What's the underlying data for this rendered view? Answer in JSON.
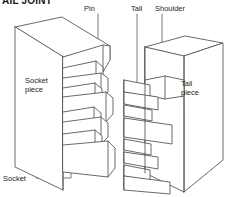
{
  "figure": {
    "title": "AIL JOINT",
    "background_color": "#ffffff",
    "line_color": "#58595b",
    "text_color": "#231f20"
  },
  "labels": {
    "pin": "Pin",
    "tail": "Tail",
    "shoulder": "Shoulder",
    "socket_piece_line1": "Socket",
    "socket_piece_line2": "piece",
    "tail_piece_line1": "Tail",
    "tail_piece_line2": "piece",
    "socket": "Socket"
  }
}
